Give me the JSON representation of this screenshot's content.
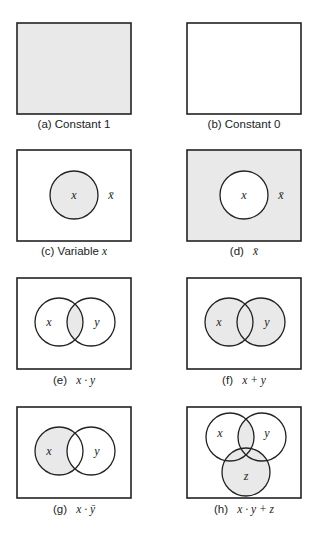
{
  "colors": {
    "shade": "#e9e9e9",
    "stroke": "#222222",
    "background": "#ffffff"
  },
  "panels": [
    {
      "id": "a",
      "tag": "(a)",
      "caption": "Constant 1",
      "expr": ""
    },
    {
      "id": "b",
      "tag": "(b)",
      "caption": "Constant 0",
      "expr": ""
    },
    {
      "id": "c",
      "tag": "(c)",
      "caption": "Variable",
      "expr": "x"
    },
    {
      "id": "d",
      "tag": "(d)",
      "caption": "",
      "expr": "x̄"
    },
    {
      "id": "e",
      "tag": "(e)",
      "caption": "",
      "expr": "x · y"
    },
    {
      "id": "f",
      "tag": "(f)",
      "caption": "",
      "expr": "x + y"
    },
    {
      "id": "g",
      "tag": "(g)",
      "caption": "",
      "expr": "x · ȳ"
    },
    {
      "id": "h",
      "tag": "(h)",
      "caption": "",
      "expr": "x · y + z"
    }
  ],
  "labels": {
    "x": "x",
    "y": "y",
    "z": "z",
    "xbar": "x̄"
  }
}
